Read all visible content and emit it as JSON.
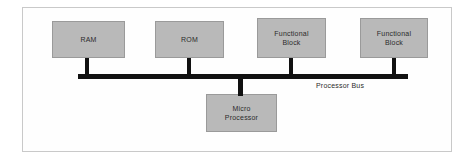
{
  "diagram": {
    "colors": {
      "block_fill": "#b9b9b9",
      "block_stroke": "#9a9a9a",
      "bus": "#111111",
      "frame": "#c9c9c9",
      "background": "#ffffff",
      "text": "#2b2b2b"
    },
    "bus": {
      "label": "Processor Bus",
      "orientation": "horizontal"
    },
    "blocks": [
      {
        "id": "ram",
        "label": "RAM",
        "side": "top",
        "connector": "stub-down"
      },
      {
        "id": "rom",
        "label": "ROM",
        "side": "top",
        "connector": "stub-down"
      },
      {
        "id": "functional-1",
        "label": "Functional\nBlock",
        "side": "top",
        "connector": "stub-down"
      },
      {
        "id": "functional-2",
        "label": "Functional\nBlock",
        "side": "top",
        "connector": "stub-down"
      },
      {
        "id": "micro-processor",
        "label": "Micro\nProcessor",
        "side": "bottom",
        "connector": "stub-up"
      }
    ]
  }
}
